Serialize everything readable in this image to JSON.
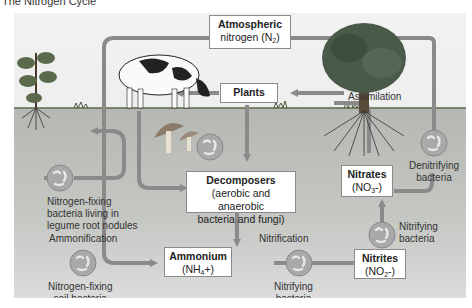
{
  "caption": "The Nitrogen Cycle",
  "colors": {
    "arrow": "#8a8a8a",
    "soil": "#b4b7b2",
    "sky": "#efefef",
    "box_bg": "#ffffff",
    "bacteria": "#a9a9a9"
  },
  "boxes": {
    "atmospheric": {
      "title": "Atmospheric",
      "line2": "nitrogen (N",
      "sub": "2",
      "close": ")"
    },
    "plants": {
      "title": "Plants"
    },
    "decomposers": {
      "title": "Decomposers",
      "line2": "(aerobic and anaerobic",
      "line3": "bacteria and fungi)"
    },
    "ammonium": {
      "title": "Ammonium",
      "line2": "(NH",
      "sub": "4",
      "close": "+)"
    },
    "nitrites": {
      "title": "Nitrites",
      "line2": "(NO",
      "sub": "2",
      "close": "-)"
    },
    "nitrates": {
      "title": "Nitrates",
      "line2": "(NO",
      "sub": "3",
      "close": "-)"
    }
  },
  "labels": {
    "assimilation": "Assimilation",
    "denitrifying_1": "Denitrifying",
    "denitrifying_2": "bacteria",
    "legume_1": "Nitrogen-fixing",
    "legume_2": "bacteria living in",
    "legume_3": "legume root nodules",
    "ammonification": "Ammonification",
    "soil_fixing_1": "Nitrogen-fixing",
    "soil_fixing_2": "soil bacteria",
    "nitrification": "Nitrification",
    "nitrifying_a_1": "Nitrifying",
    "nitrifying_a_2": "bacteria",
    "nitrifying_b_1": "Nitrifying",
    "nitrifying_b_2": "bacteria"
  },
  "icons": [
    "cow-illustration",
    "tree-illustration",
    "legume-plant-illustration",
    "mushroom-illustration",
    "bacteria-icon"
  ]
}
